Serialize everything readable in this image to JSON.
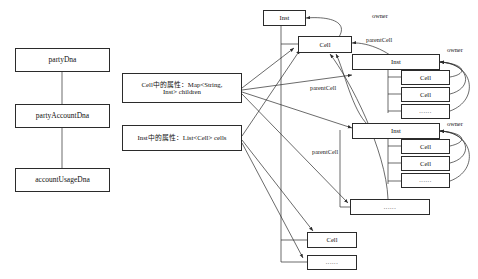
{
  "diagram": {
    "background_color": "#ffffff",
    "stroke_color": "#2b2b2b",
    "left_chain": {
      "name": "dna-chain",
      "nodes": [
        {
          "id": "partyDna",
          "label": "partyDna"
        },
        {
          "id": "partyAccountDna",
          "label": "partyAccountDna"
        },
        {
          "id": "accountUsageDna",
          "label": "accountUsageDna"
        }
      ]
    },
    "notes": [
      {
        "id": "note-cell",
        "label": "Cell中的属性：Map<String,\nInst> children"
      },
      {
        "id": "note-inst",
        "label": "Inst中的属性：List<Cell> cells"
      }
    ],
    "tree": {
      "root_inst": {
        "id": "inst-root",
        "label": "Inst"
      },
      "root_cell": {
        "id": "cell-root",
        "label": "Cell"
      },
      "inst_a": {
        "id": "inst-a",
        "label": "Inst",
        "cells": [
          {
            "id": "inst-a-cell-1",
            "label": "Cell"
          },
          {
            "id": "inst-a-cell-2",
            "label": "Cell"
          },
          {
            "id": "inst-a-cell-more",
            "label": "......"
          }
        ]
      },
      "inst_b": {
        "id": "inst-b",
        "label": "Inst",
        "cells": [
          {
            "id": "inst-b-cell-1",
            "label": "Cell"
          },
          {
            "id": "inst-b-cell-2",
            "label": "Cell"
          },
          {
            "id": "inst-b-cell-more",
            "label": "......"
          }
        ]
      },
      "inst_more": {
        "id": "inst-more",
        "label": "......"
      },
      "bottom_cell": {
        "id": "cell-bottom",
        "label": "Cell"
      },
      "bottom_more": {
        "id": "cell-bottom-more",
        "label": "......"
      }
    },
    "edge_labels": [
      {
        "id": "owner-1",
        "label": "owner"
      },
      {
        "id": "owner-2",
        "label": "owner"
      },
      {
        "id": "owner-3",
        "label": "owner"
      },
      {
        "id": "parentcell-1",
        "label": "parentCell"
      },
      {
        "id": "parentcell-2",
        "label": "parentCell"
      },
      {
        "id": "parentcell-3",
        "label": "parentCell"
      }
    ]
  }
}
